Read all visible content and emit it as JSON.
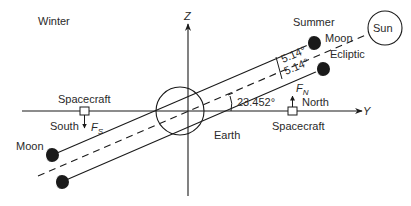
{
  "diagram": {
    "labels": {
      "winter": "Winter",
      "summer": "Summer",
      "sun": "Sun",
      "moon_upper": "Moon",
      "moon_left": "Moon",
      "ecliptic": "Ecliptic",
      "angle_upper": "5.14°",
      "angle_lower": "5.14°",
      "obliquity": "23.452°",
      "earth": "Earth",
      "spacecraft_left": "Spacecraft",
      "spacecraft_right": "Spacecraft",
      "south": "South",
      "north": "North",
      "force_south": "F",
      "force_south_sub": "S",
      "force_north": "F",
      "force_north_sub": "N",
      "axis_y": "Y",
      "axis_z": "Z"
    },
    "colors": {
      "ink": "#1a1a1a",
      "background": "#ffffff"
    }
  }
}
